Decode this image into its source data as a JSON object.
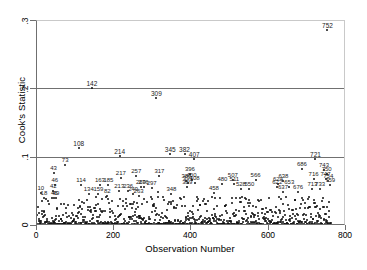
{
  "chart_data": {
    "type": "scatter",
    "title": "",
    "xlabel": "Observation Number",
    "ylabel": "Cook's Statistic",
    "xlim": [
      0,
      800
    ],
    "ylim": [
      0,
      0.3
    ],
    "xticks": [
      "0",
      "200",
      "400",
      "600",
      "800"
    ],
    "xtick_values": [
      0,
      200,
      400,
      600,
      800
    ],
    "yticks": [
      "0",
      ".1",
      ".2",
      ".3"
    ],
    "ytick_values": [
      0,
      0.1,
      0.2,
      0.3
    ],
    "grid": "horizontal gridlines at .1 and .2",
    "legend": "none",
    "n_observations": 760,
    "labeled_points": [
      {
        "label": "752",
        "x": 752,
        "y": 0.285
      },
      {
        "label": "142",
        "x": 142,
        "y": 0.2
      },
      {
        "label": "309",
        "x": 309,
        "y": 0.186
      },
      {
        "label": "108",
        "x": 108,
        "y": 0.113
      },
      {
        "label": "214",
        "x": 214,
        "y": 0.101
      },
      {
        "label": "345",
        "x": 345,
        "y": 0.104
      },
      {
        "label": "382",
        "x": 382,
        "y": 0.104
      },
      {
        "label": "407",
        "x": 407,
        "y": 0.096
      },
      {
        "label": "721",
        "x": 721,
        "y": 0.097
      },
      {
        "label": "73",
        "x": 73,
        "y": 0.088
      },
      {
        "label": "686",
        "x": 686,
        "y": 0.082
      },
      {
        "label": "743",
        "x": 743,
        "y": 0.08
      },
      {
        "label": "43",
        "x": 43,
        "y": 0.076
      },
      {
        "label": "750",
        "x": 750,
        "y": 0.074
      },
      {
        "label": "396",
        "x": 396,
        "y": 0.075
      },
      {
        "label": "257",
        "x": 257,
        "y": 0.072
      },
      {
        "label": "317",
        "x": 317,
        "y": 0.071
      },
      {
        "label": "217",
        "x": 217,
        "y": 0.069
      },
      {
        "label": "716",
        "x": 716,
        "y": 0.068
      },
      {
        "label": "747",
        "x": 747,
        "y": 0.068
      },
      {
        "label": "387",
        "x": 387,
        "y": 0.065
      },
      {
        "label": "400",
        "x": 400,
        "y": 0.066
      },
      {
        "label": "507",
        "x": 507,
        "y": 0.066
      },
      {
        "label": "566",
        "x": 566,
        "y": 0.066
      },
      {
        "label": "638",
        "x": 638,
        "y": 0.065
      },
      {
        "label": "754",
        "x": 754,
        "y": 0.064
      },
      {
        "label": "391",
        "x": 391,
        "y": 0.062
      },
      {
        "label": "408",
        "x": 408,
        "y": 0.061
      },
      {
        "label": "480",
        "x": 480,
        "y": 0.06
      },
      {
        "label": "511",
        "x": 511,
        "y": 0.06
      },
      {
        "label": "624",
        "x": 624,
        "y": 0.06
      },
      {
        "label": "759",
        "x": 759,
        "y": 0.059
      },
      {
        "label": "114",
        "x": 114,
        "y": 0.058
      },
      {
        "label": "163",
        "x": 163,
        "y": 0.058
      },
      {
        "label": "185",
        "x": 185,
        "y": 0.058
      },
      {
        "label": "46",
        "x": 46,
        "y": 0.058
      },
      {
        "label": "389",
        "x": 389,
        "y": 0.055
      },
      {
        "label": "622",
        "x": 622,
        "y": 0.055
      },
      {
        "label": "653",
        "x": 653,
        "y": 0.056
      },
      {
        "label": "528",
        "x": 528,
        "y": 0.053
      },
      {
        "label": "550",
        "x": 550,
        "y": 0.053
      },
      {
        "label": "713",
        "x": 713,
        "y": 0.053
      },
      {
        "label": "733",
        "x": 733,
        "y": 0.053
      },
      {
        "label": "269",
        "x": 269,
        "y": 0.055
      },
      {
        "label": "276",
        "x": 276,
        "y": 0.055
      },
      {
        "label": "297",
        "x": 297,
        "y": 0.054
      },
      {
        "label": "42",
        "x": 42,
        "y": 0.05
      },
      {
        "label": "213",
        "x": 213,
        "y": 0.05
      },
      {
        "label": "236",
        "x": 236,
        "y": 0.05
      },
      {
        "label": "637",
        "x": 637,
        "y": 0.048
      },
      {
        "label": "676",
        "x": 676,
        "y": 0.048
      },
      {
        "label": "10",
        "x": 10,
        "y": 0.047
      },
      {
        "label": "159",
        "x": 159,
        "y": 0.046
      },
      {
        "label": "134",
        "x": 134,
        "y": 0.045
      },
      {
        "label": "249",
        "x": 249,
        "y": 0.045
      },
      {
        "label": "348",
        "x": 348,
        "y": 0.046
      },
      {
        "label": "458",
        "x": 458,
        "y": 0.047
      },
      {
        "label": "18",
        "x": 18,
        "y": 0.04
      },
      {
        "label": "45",
        "x": 45,
        "y": 0.039
      },
      {
        "label": "49",
        "x": 49,
        "y": 0.039
      },
      {
        "label": "82",
        "x": 182,
        "y": 0.042
      },
      {
        "label": "263",
        "x": 263,
        "y": 0.042
      }
    ]
  }
}
